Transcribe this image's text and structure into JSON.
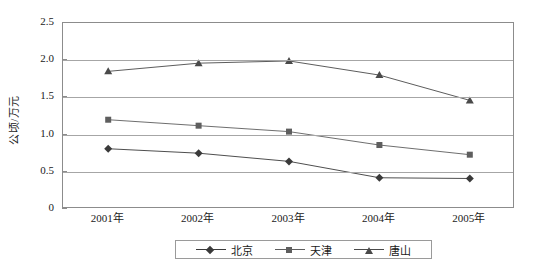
{
  "chart_data": {
    "type": "line",
    "title": "",
    "xlabel": "",
    "ylabel": "公顷/万元",
    "categories": [
      "2001年",
      "2002年",
      "2003年",
      "2004年",
      "2005年"
    ],
    "ylim": [
      0,
      2.5
    ],
    "ytick_labels": [
      "0",
      "0.5",
      "1.0",
      "1.5",
      "2.0",
      "2.5"
    ],
    "ytick_values": [
      0,
      0.5,
      1.0,
      1.5,
      2.0,
      2.5
    ],
    "grid": true,
    "legend_position": "bottom",
    "series": [
      {
        "name": "北京",
        "marker": "diamond",
        "color": "#3a3a3a",
        "values": [
          0.81,
          0.75,
          0.64,
          0.42,
          0.41
        ]
      },
      {
        "name": "天津",
        "marker": "square",
        "color": "#5e5e5e",
        "values": [
          1.2,
          1.12,
          1.04,
          0.86,
          0.73
        ]
      },
      {
        "name": "唐山",
        "marker": "triangle",
        "color": "#4a4a4a",
        "values": [
          1.85,
          1.96,
          1.99,
          1.8,
          1.46
        ]
      }
    ]
  }
}
